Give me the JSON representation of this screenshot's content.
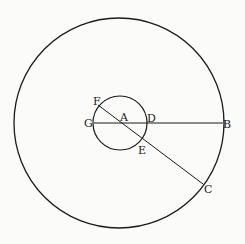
{
  "diagram": {
    "type": "geometry-concentric-circles",
    "stroke_color": "#1a1a1a",
    "background": "#fbfbf9",
    "outer_circle": {
      "cx": 119,
      "cy": 123,
      "r": 105
    },
    "inner_circle": {
      "cx": 120,
      "cy": 123,
      "r": 27
    },
    "lines": [
      {
        "name": "GB",
        "from": "G",
        "to": "B"
      },
      {
        "name": "FC",
        "from": "F",
        "to": "C"
      }
    ],
    "labels": {
      "A": "A",
      "B": "B",
      "C": "C",
      "D": "D",
      "E": "E",
      "F": "F",
      "G": "G"
    }
  }
}
